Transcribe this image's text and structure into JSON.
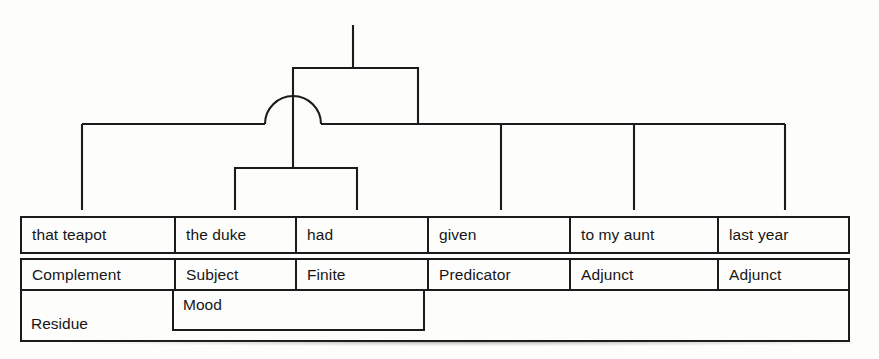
{
  "diagram": {
    "clause": "that teapot the duke had given to my aunt last year",
    "line_color": "#1b1b1b",
    "background_color": "#fdfdfb"
  },
  "table": {
    "columns": [
      {
        "word": "that teapot",
        "function": "Complement"
      },
      {
        "word": "the duke",
        "function": "Subject"
      },
      {
        "word": "had",
        "function": "Finite"
      },
      {
        "word": "given",
        "function": "Predicator"
      },
      {
        "word": "to my aunt",
        "function": "Adjunct"
      },
      {
        "word": "last year",
        "function": "Adjunct"
      }
    ],
    "structure": {
      "mood": "Mood",
      "residue": "Residue"
    }
  },
  "tree": {
    "root_stem": {
      "x": 353,
      "y_top": 25,
      "y_bottom": 68
    },
    "outer_bracket": {
      "x_left": 293,
      "x_right": 418,
      "y": 68,
      "leg_bottom": 124
    },
    "main_bar": {
      "x_left": 82,
      "x_right": 785,
      "y": 124
    },
    "arc": {
      "center_x": 293,
      "center_y": 124,
      "radius": 28
    },
    "inner_bracket": {
      "x_left": 235,
      "x_right": 357,
      "y": 168,
      "leg_bottom": 210
    },
    "center_spine": {
      "x": 293,
      "y_top": 96,
      "y_bottom": 168
    },
    "legs_to_table": [
      82,
      235,
      357,
      501,
      634,
      785
    ],
    "leg_bottom_y": 210
  }
}
